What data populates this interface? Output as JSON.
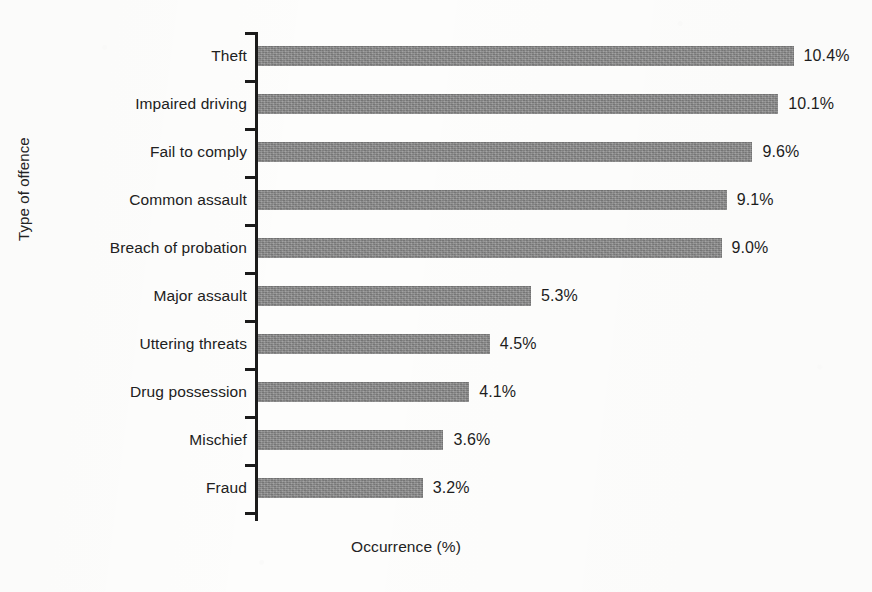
{
  "chart_data": {
    "type": "bar",
    "orientation": "horizontal",
    "title": "",
    "xlabel": "Occurrence (%)",
    "ylabel": "Type of offence",
    "categories": [
      "Theft",
      "Impaired driving",
      "Fail to comply",
      "Common assault",
      "Breach of probation",
      "Major assault",
      "Uttering threats",
      "Drug possession",
      "Mischief",
      "Fraud"
    ],
    "values": [
      10.4,
      10.1,
      9.6,
      9.1,
      9.0,
      5.3,
      4.5,
      4.1,
      3.6,
      3.2
    ],
    "value_labels": [
      "10.4%",
      "10.1%",
      "9.6%",
      "9.1%",
      "9.0%",
      "5.3%",
      "4.5%",
      "4.1%",
      "3.6%",
      "3.2%"
    ],
    "xlim": [
      0,
      10.4
    ],
    "grid": false,
    "legend": null,
    "bar_color": "#8b8b8b",
    "axis_color": "#1b1b1b",
    "text_color": "#1d1d1d",
    "background_color": "#fdfdfc"
  },
  "layout": {
    "px_per_percent": 51.5,
    "bar_thickness_px": 20,
    "category_pitch_px": 48,
    "axis_left_px": 256,
    "axis_top_px": 32,
    "axis_bottom_px": 521
  }
}
